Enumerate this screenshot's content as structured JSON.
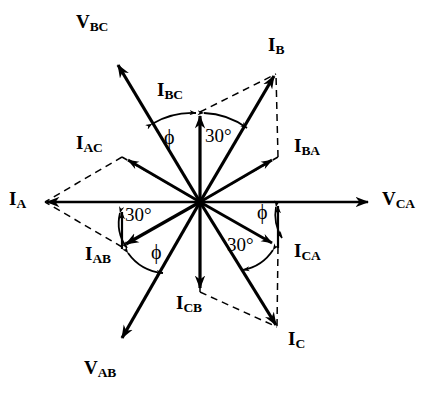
{
  "diagram": {
    "origin": {
      "x": 200,
      "y": 202
    },
    "colors": {
      "stroke": "#000000",
      "background": "#ffffff"
    },
    "phasors": [
      {
        "name": "V_BC",
        "label_main": "V",
        "label_sub": "BC",
        "angle_deg": 121,
        "length": 160,
        "style": "solid",
        "label_x": 76,
        "label_y": 12
      },
      {
        "name": "V_CA",
        "label_main": "V",
        "label_sub": "CA",
        "angle_deg": 0,
        "length": 172,
        "style": "solid",
        "label_x": 382,
        "label_y": 190
      },
      {
        "name": "V_AB",
        "label_main": "V",
        "label_sub": "AB",
        "angle_deg": 241,
        "length": 160,
        "style": "solid",
        "label_x": 86,
        "label_y": 360
      },
      {
        "name": "I_A",
        "label_main": "I",
        "label_sub": "A",
        "angle_deg": 180,
        "length": 157,
        "style": "solid",
        "label_x": 10,
        "label_y": 190
      },
      {
        "name": "I_B",
        "label_main": "I",
        "label_sub": "B",
        "angle_deg": 61,
        "length": 147,
        "style": "solid",
        "label_x": 268,
        "label_y": 36
      },
      {
        "name": "I_C",
        "label_main": "I",
        "label_sub": "C",
        "angle_deg": -59,
        "length": 149,
        "style": "solid",
        "label_x": 288,
        "label_y": 330
      },
      {
        "name": "I_BC",
        "label_main": "I",
        "label_sub": "BC",
        "angle_deg": 90,
        "length": 90,
        "style": "solid",
        "label_x": 158,
        "label_y": 81
      },
      {
        "name": "I_AB",
        "label_main": "I",
        "label_sub": "AB",
        "angle_deg": 210,
        "length": 90,
        "style": "solid",
        "label_x": 88,
        "label_y": 245
      },
      {
        "name": "I_CA",
        "label_main": "I",
        "label_sub": "CA",
        "angle_deg": -30,
        "length": 90,
        "style": "solid",
        "label_x": 296,
        "label_y": 243
      },
      {
        "name": "I_BA",
        "label_main": "I",
        "label_sub": "BA",
        "angle_deg": 30,
        "length": 90,
        "style": "solid",
        "label_x": 296,
        "label_y": 137
      },
      {
        "name": "I_AC",
        "label_main": "I",
        "label_sub": "AC",
        "angle_deg": 150,
        "length": 90,
        "style": "solid",
        "label_x": 76,
        "label_y": 134
      },
      {
        "name": "I_CB",
        "label_main": "I",
        "label_sub": "CB",
        "angle_deg": -90,
        "length": 90,
        "style": "solid",
        "label_x": 176,
        "label_y": 294
      }
    ],
    "angle_annotations": [
      {
        "name": "phi-top",
        "text": "ϕ",
        "x": 165,
        "y": 128
      },
      {
        "name": "thirty-top",
        "text": "30°",
        "x": 206,
        "y": 127
      },
      {
        "name": "thirty-left",
        "text": "30°",
        "x": 126,
        "y": 206
      },
      {
        "name": "phi-left",
        "text": "ϕ",
        "x": 152,
        "y": 243
      },
      {
        "name": "phi-right",
        "text": "ϕ",
        "x": 258,
        "y": 203
      },
      {
        "name": "thirty-right",
        "text": "30°",
        "x": 228,
        "y": 236
      }
    ]
  }
}
